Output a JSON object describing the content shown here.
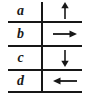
{
  "figure": {
    "columns": [
      "label",
      "direction"
    ],
    "ink_color": "#171717",
    "background_color": "#ffffff",
    "rows": [
      {
        "label": "a",
        "arrow": "arrow-up-icon",
        "direction": "up"
      },
      {
        "label": "b",
        "arrow": "arrow-right-icon",
        "direction": "right"
      },
      {
        "label": "c",
        "arrow": "arrow-down-icon",
        "direction": "down"
      },
      {
        "label": "d",
        "arrow": "arrow-left-icon",
        "direction": "left"
      }
    ]
  }
}
